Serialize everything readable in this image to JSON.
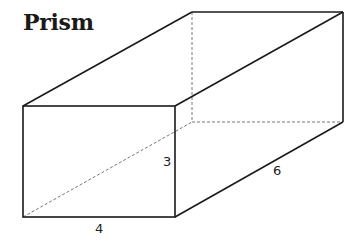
{
  "title": "Prism",
  "figure": {
    "type": "rectangular prism",
    "labels": {
      "height": "3",
      "width": "4",
      "depth": "6"
    },
    "colors": {
      "stroke": "#1a1a1a",
      "hidden_edge": "#777777",
      "background": "#ffffff"
    }
  }
}
